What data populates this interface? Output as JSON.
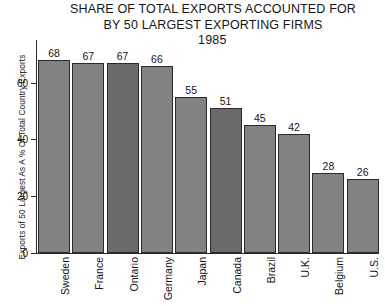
{
  "chart_data": {
    "type": "bar",
    "title": "SHARE OF TOTAL EXPORTS ACCOUNTED FOR BY 50 LARGEST EXPORTING FIRMS 1985",
    "title_lines": [
      "SHARE OF TOTAL EXPORTS ACCOUNTED FOR",
      "BY 50 LARGEST EXPORTING FIRMS"
    ],
    "year": "1985",
    "xlabel": "",
    "ylabel": "Exports of 50 Largest As A % Of Total Country Exports",
    "ylim": [
      0,
      75
    ],
    "yticks": [
      0,
      20,
      40,
      60
    ],
    "ytick_labels": [
      "0",
      "20",
      "40",
      "60"
    ],
    "grid": false,
    "legend": "none",
    "categories": [
      "Sweden",
      "France",
      "Ontario",
      "Germany",
      "Japan",
      "Canada",
      "Brazil",
      "U.K.",
      "Belgium",
      "U.S."
    ],
    "values": [
      68,
      67,
      67,
      66,
      55,
      51,
      45,
      42,
      28,
      26
    ],
    "value_labels": [
      "68",
      "67",
      "67",
      "66",
      "55",
      "51",
      "45",
      "42",
      "28",
      "26"
    ],
    "bar_colors": [
      "#828282",
      "#828282",
      "#6a6a6a",
      "#828282",
      "#828282",
      "#6a6a6a",
      "#828282",
      "#828282",
      "#828282",
      "#828282"
    ],
    "bar_edge_color": "#2b2b2b",
    "axis_color": "#2a2a2a",
    "text_color": "#151515",
    "background": "#ffffff"
  }
}
